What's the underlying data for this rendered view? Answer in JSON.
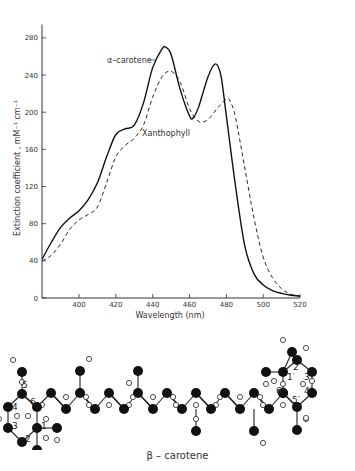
{
  "chart_data": {
    "type": "line",
    "title": "",
    "xlabel": "Wavelength (nm)",
    "ylabel": "Extinction coefficient , mM⁻¹ cm⁻¹",
    "xlim": [
      380,
      520
    ],
    "ylim": [
      0,
      290
    ],
    "x_ticks": [
      400,
      420,
      440,
      460,
      480,
      500,
      520
    ],
    "y_ticks": [
      0,
      40,
      80,
      120,
      160,
      200,
      240,
      280
    ],
    "grid": false,
    "legend_position": "inline labels",
    "series": [
      {
        "name": "α–carotene",
        "style": "solid",
        "x": [
          380,
          385,
          390,
          395,
          400,
          405,
          410,
          415,
          420,
          425,
          430,
          435,
          440,
          445,
          447,
          450,
          455,
          460,
          462,
          465,
          470,
          474,
          477,
          480,
          485,
          490,
          495,
          500,
          505,
          510,
          515,
          520
        ],
        "y": [
          42,
          60,
          76,
          86,
          94,
          106,
          124,
          152,
          176,
          182,
          186,
          210,
          248,
          268,
          270,
          262,
          224,
          196,
          194,
          206,
          238,
          252,
          240,
          196,
          120,
          56,
          26,
          14,
          8,
          5,
          3,
          2
        ]
      },
      {
        "name": "Xanthophyll",
        "style": "dashed",
        "x": [
          380,
          385,
          390,
          395,
          400,
          405,
          410,
          415,
          420,
          425,
          430,
          435,
          440,
          445,
          450,
          455,
          460,
          465,
          470,
          475,
          480,
          482,
          485,
          490,
          495,
          500,
          505,
          510,
          515,
          520
        ],
        "y": [
          40,
          46,
          58,
          74,
          84,
          90,
          98,
          124,
          152,
          164,
          172,
          186,
          216,
          238,
          244,
          232,
          204,
          190,
          192,
          204,
          214,
          212,
          194,
          140,
          86,
          44,
          22,
          10,
          4,
          2
        ]
      }
    ]
  },
  "labels": {
    "series1": "α–carotene",
    "series2": "Xanthophyll",
    "xlabel": "Wavelength (nm)",
    "ylabel": "Extinction coefficient , mM⁻¹ cm⁻¹",
    "molecule_caption": "β – carotene"
  },
  "molecule": {
    "name": "β – carotene",
    "left_ring_numbers": [
      "1",
      "2",
      "3",
      "4",
      "5",
      "6"
    ],
    "right_ring_numbers": [
      "1′",
      "2′",
      "3′",
      "4′",
      "5′",
      "6′"
    ]
  }
}
